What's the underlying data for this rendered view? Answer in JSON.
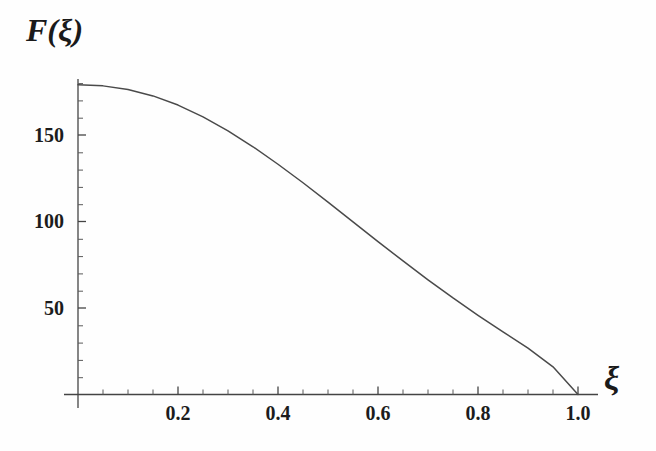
{
  "figure": {
    "background_color": "#fefefe",
    "axis_color": "#404040",
    "curve_color": "#4a4a4a",
    "text_color": "#1a1a1a"
  },
  "axes": {
    "ylabel": "F(ξ)",
    "xlabel": "ξ",
    "x_ticks_major": [
      "0.2",
      "0.4",
      "0.6",
      "0.8",
      "1.0"
    ],
    "y_ticks_major": [
      "50",
      "100",
      "150"
    ]
  },
  "chart_data": {
    "type": "line",
    "title": "",
    "xlabel": "ξ",
    "ylabel": "F(ξ)",
    "xlim": [
      0.0,
      1.06
    ],
    "ylim": [
      0,
      188
    ],
    "grid": false,
    "legend": "none",
    "x_tick_values": [
      0.2,
      0.4,
      0.6,
      0.8,
      1.0
    ],
    "x_tick_labels": [
      "0.2",
      "0.4",
      "0.6",
      "0.8",
      "1.0"
    ],
    "x_minor_tick_step": 0.05,
    "y_tick_values": [
      50,
      100,
      150
    ],
    "y_tick_labels": [
      "50",
      "100",
      "150"
    ],
    "y_minor_tick_step": 10,
    "series": [
      {
        "name": "F(ξ)",
        "x": [
          0.0,
          0.05,
          0.1,
          0.15,
          0.2,
          0.25,
          0.3,
          0.35,
          0.4,
          0.45,
          0.5,
          0.55,
          0.6,
          0.65,
          0.7,
          0.75,
          0.8,
          0.85,
          0.9,
          0.95,
          1.0
        ],
        "values": [
          179.0,
          178.4,
          176.3,
          172.6,
          167.3,
          160.5,
          152.4,
          143.2,
          133.1,
          122.4,
          111.2,
          99.8,
          88.4,
          77.2,
          66.3,
          55.8,
          45.8,
          36.2,
          26.8,
          16.0,
          0.0
        ]
      }
    ],
    "annotations": [
      {
        "text": "curve starts flat at F(0) ≈ 179 and decreases monotonically to 0 at ξ = 1.0"
      }
    ]
  }
}
